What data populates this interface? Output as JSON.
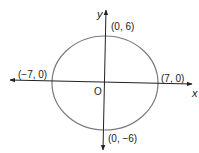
{
  "diagram": {
    "type": "ellipse-on-coordinate-axes",
    "axes": {
      "x_label": "x",
      "y_label": "y",
      "origin_label": "O"
    },
    "points": [
      {
        "label": "(0, 6)",
        "x": 0,
        "y": 6
      },
      {
        "label": "(0, −6)",
        "x": 0,
        "y": -6
      },
      {
        "label": "(−7, 0)",
        "x": -7,
        "y": 0
      },
      {
        "label": "(7, 0)",
        "x": 7,
        "y": 0
      }
    ],
    "ellipse": {
      "center": [
        0,
        0
      ],
      "semi_major_x": 7,
      "semi_minor_y": 6
    },
    "colors": {
      "ellipse": "#7a7a7a",
      "axes": "#222222"
    }
  }
}
